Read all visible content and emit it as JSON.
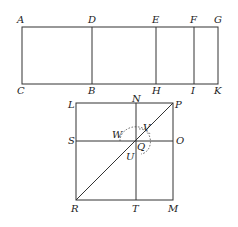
{
  "figure_top": {
    "description": "Rectangle ACKG divided by vertical lines DB, EH, FI",
    "labels": {
      "A": "A",
      "D": "D",
      "E": "E",
      "F": "F",
      "G": "G",
      "C": "C",
      "B": "B",
      "H": "H",
      "I": "I",
      "K": "K"
    }
  },
  "figure_bottom": {
    "description": "Square LPMR with diagonal RP, vertical NT, horizontal SO, dashed circle around Q",
    "labels": {
      "L": "L",
      "N": "N",
      "P": "P",
      "S": "S",
      "O": "O",
      "W": "W",
      "V": "V",
      "Q": "Q",
      "U": "U",
      "R": "R",
      "T": "T",
      "M": "M"
    }
  }
}
